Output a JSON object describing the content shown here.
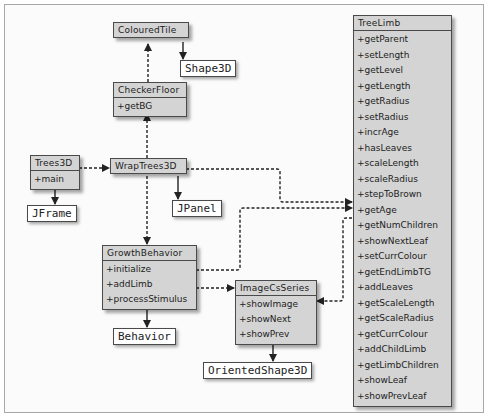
{
  "diagram": {
    "type": "UML class diagram",
    "classes": {
      "coloured_tile": {
        "name": "ColouredTile",
        "methods": []
      },
      "checker_floor": {
        "name": "CheckerFloor",
        "methods": [
          "+getBG"
        ]
      },
      "trees3d": {
        "name": "Trees3D",
        "methods": [
          "+main"
        ]
      },
      "wrap_trees3d": {
        "name": "WrapTrees3D",
        "methods": []
      },
      "growth_behavior": {
        "name": "GrowthBehavior",
        "methods": [
          "+initialize",
          "+addLimb",
          "+processStimulus"
        ]
      },
      "image_cs_series": {
        "name": "ImageCsSeries",
        "methods": [
          "+showImage",
          "+showNext",
          "+showPrev"
        ]
      },
      "tree_limb": {
        "name": "TreeLimb",
        "methods": [
          "+getParent",
          "+setLength",
          "+getLevel",
          "+getLength",
          "+getRadius",
          "+setRadius",
          "+incrAge",
          "+hasLeaves",
          "+scaleLength",
          "+scaleRadius",
          "+stepToBrown",
          "+getAge",
          "+getNumChildren",
          "+showNextLeaf",
          "+setCurrColour",
          "+getEndLimbTG",
          "+addLeaves",
          "+getScaleLength",
          "+getScaleRadius",
          "+getCurrColour",
          "+addChildLimb",
          "+getLimbChildren",
          "+showLeaf",
          "+showPrevLeaf"
        ]
      }
    },
    "library_classes": {
      "shape3d": "Shape3D",
      "jframe": "JFrame",
      "jpanel": "JPanel",
      "behavior": "Behavior",
      "oriented_shape3d": "OrientedShape3D"
    },
    "relations": [
      {
        "from": "ColouredTile",
        "to": "Shape3D",
        "kind": "inheritance"
      },
      {
        "from": "CheckerFloor",
        "to": "ColouredTile",
        "kind": "dependency"
      },
      {
        "from": "Trees3D",
        "to": "JFrame",
        "kind": "inheritance"
      },
      {
        "from": "Trees3D",
        "to": "WrapTrees3D",
        "kind": "dependency"
      },
      {
        "from": "WrapTrees3D",
        "to": "JPanel",
        "kind": "inheritance"
      },
      {
        "from": "WrapTrees3D",
        "to": "CheckerFloor",
        "kind": "dependency"
      },
      {
        "from": "WrapTrees3D",
        "to": "GrowthBehavior",
        "kind": "dependency"
      },
      {
        "from": "WrapTrees3D",
        "to": "TreeLimb",
        "kind": "dependency"
      },
      {
        "from": "GrowthBehavior",
        "to": "Behavior",
        "kind": "inheritance"
      },
      {
        "from": "GrowthBehavior",
        "to": "TreeLimb",
        "kind": "dependency"
      },
      {
        "from": "GrowthBehavior",
        "to": "ImageCsSeries",
        "kind": "dependency"
      },
      {
        "from": "TreeLimb",
        "to": "ImageCsSeries",
        "kind": "dependency"
      },
      {
        "from": "ImageCsSeries",
        "to": "OrientedShape3D",
        "kind": "inheritance"
      }
    ]
  }
}
